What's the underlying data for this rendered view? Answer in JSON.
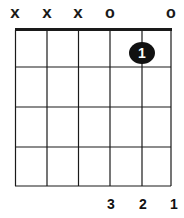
{
  "diagram": {
    "type": "guitar-chord-diagram",
    "strings": 6,
    "frets_shown": 4,
    "string_markers": [
      "x",
      "x",
      "x",
      "o",
      "",
      "o"
    ],
    "dots": [
      {
        "string": 5,
        "fret": 1,
        "label": "1"
      }
    ],
    "finger_numbers": [
      {
        "string": 4,
        "label": "3"
      },
      {
        "string": 5,
        "label": "2"
      },
      {
        "string": 6,
        "label": "1"
      }
    ],
    "colors": {
      "line": "#1a1a1a",
      "dot": "#111111",
      "dot_text": "#ffffff",
      "background": "#ffffff"
    }
  }
}
